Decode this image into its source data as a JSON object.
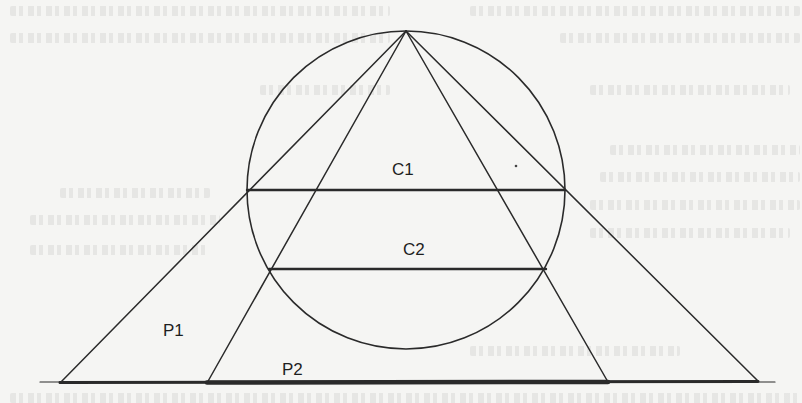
{
  "figure": {
    "labels": {
      "c1": "C1",
      "c2": "C2",
      "p1": "P1",
      "p2": "P2"
    },
    "colors": {
      "ink": "#2a2a2a",
      "paper": "#f5f5f3"
    },
    "geometry": {
      "apex": [
        406,
        31
      ],
      "circle": {
        "cx": 406,
        "cy": 190,
        "r": 159
      },
      "chord_c1": {
        "y": 190,
        "x1": 247,
        "x2": 565
      },
      "chord_c2": {
        "y": 269,
        "x1": 269,
        "x2": 546
      },
      "outer_triangle_base": [
        [
          60,
          383
        ],
        [
          758,
          381
        ]
      ],
      "inner_triangle_base": [
        [
          207,
          383
        ],
        [
          608,
          382
        ]
      ],
      "baseline": {
        "x1": 40,
        "x2": 775,
        "y": 382
      }
    }
  }
}
